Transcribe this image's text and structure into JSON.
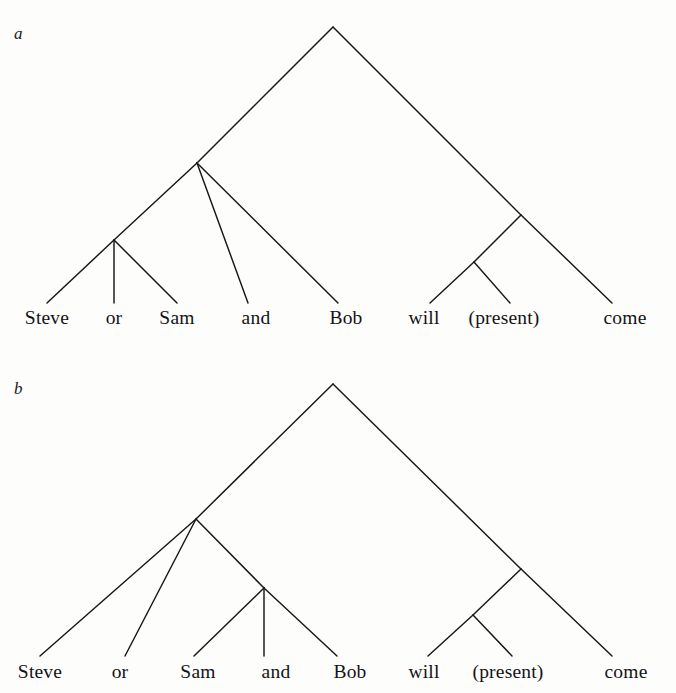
{
  "figure": {
    "type": "syntax-tree-pair",
    "ink_color": "#17171a",
    "background_color": "#fdfdfc"
  },
  "panels": [
    {
      "id": "a",
      "label": "a",
      "leaves": [
        {
          "text": "Steve",
          "x": 47,
          "attach_x": 47
        },
        {
          "text": "or",
          "x": 114,
          "attach_x": 114
        },
        {
          "text": "Sam",
          "x": 177,
          "attach_x": 177
        },
        {
          "text": "and",
          "x": 256,
          "attach_x": 248
        },
        {
          "text": "Bob",
          "x": 346,
          "attach_x": 338
        },
        {
          "text": "will",
          "x": 424,
          "attach_x": 430
        },
        {
          "text": "(present)",
          "x": 504,
          "attach_x": 510
        },
        {
          "text": "come",
          "x": 625,
          "attach_x": 612
        }
      ],
      "nodes": [
        {
          "name": "root",
          "x": 333,
          "y": 27
        },
        {
          "name": "left-coord",
          "x": 197,
          "y": 163
        },
        {
          "name": "steve-or-sam",
          "x": 114,
          "y": 240
        },
        {
          "name": "predicate",
          "x": 521,
          "y": 215
        },
        {
          "name": "will-present",
          "x": 474,
          "y": 262
        }
      ],
      "edges": [
        {
          "from": "root",
          "to": "left-coord"
        },
        {
          "from": "root",
          "to": "predicate"
        },
        {
          "from": "left-coord",
          "to": "steve-or-sam"
        },
        {
          "from": "left-coord",
          "to": "leaf:and"
        },
        {
          "from": "left-coord",
          "to": "leaf:Bob"
        },
        {
          "from": "steve-or-sam",
          "to": "leaf:Steve"
        },
        {
          "from": "steve-or-sam",
          "to": "leaf:or"
        },
        {
          "from": "steve-or-sam",
          "to": "leaf:Sam"
        },
        {
          "from": "predicate",
          "to": "will-present"
        },
        {
          "from": "predicate",
          "to": "leaf:come"
        },
        {
          "from": "will-present",
          "to": "leaf:will"
        },
        {
          "from": "will-present",
          "to": "leaf:(present)"
        }
      ],
      "leaf_line_bottom_y": 303,
      "leaf_text_top_y": 307
    },
    {
      "id": "b",
      "label": "b",
      "leaves": [
        {
          "text": "Steve",
          "x": 40,
          "attach_x": 40
        },
        {
          "text": "or",
          "x": 120,
          "attach_x": 125
        },
        {
          "text": "Sam",
          "x": 198,
          "attach_x": 194
        },
        {
          "text": "and",
          "x": 276,
          "attach_x": 264
        },
        {
          "text": "Bob",
          "x": 350,
          "attach_x": 337
        },
        {
          "text": "will",
          "x": 424,
          "attach_x": 428
        },
        {
          "text": "(present)",
          "x": 508,
          "attach_x": 512
        },
        {
          "text": "come",
          "x": 626,
          "attach_x": 612
        }
      ],
      "nodes": [
        {
          "name": "root",
          "x": 333,
          "y": 384
        },
        {
          "name": "left-coord",
          "x": 196,
          "y": 519
        },
        {
          "name": "sam-and-bob",
          "x": 264,
          "y": 588
        },
        {
          "name": "predicate",
          "x": 521,
          "y": 569
        },
        {
          "name": "will-present",
          "x": 473,
          "y": 615
        }
      ],
      "edges": [
        {
          "from": "root",
          "to": "left-coord"
        },
        {
          "from": "root",
          "to": "predicate"
        },
        {
          "from": "left-coord",
          "to": "leaf:Steve"
        },
        {
          "from": "left-coord",
          "to": "leaf:or"
        },
        {
          "from": "left-coord",
          "to": "sam-and-bob"
        },
        {
          "from": "sam-and-bob",
          "to": "leaf:Sam"
        },
        {
          "from": "sam-and-bob",
          "to": "leaf:and"
        },
        {
          "from": "sam-and-bob",
          "to": "leaf:Bob"
        },
        {
          "from": "predicate",
          "to": "will-present"
        },
        {
          "from": "predicate",
          "to": "leaf:come"
        },
        {
          "from": "will-present",
          "to": "leaf:will"
        },
        {
          "from": "will-present",
          "to": "leaf:(present)"
        }
      ],
      "leaf_line_bottom_y": 656,
      "leaf_text_top_y": 661
    }
  ]
}
